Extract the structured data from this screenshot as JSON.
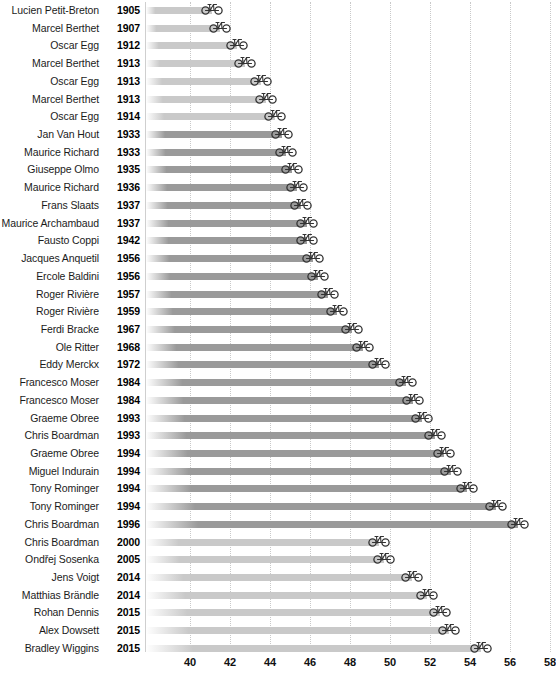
{
  "chart_data": {
    "type": "bar",
    "title": "",
    "subtitle": "",
    "xlabel": "",
    "ylabel": "",
    "orientation": "horizontal",
    "xlim": [
      38.8,
      58.6
    ],
    "xticks": [
      40,
      42,
      44,
      46,
      48,
      50,
      52,
      54,
      56,
      58
    ],
    "xtick_labels": [
      "40",
      "42",
      "44",
      "46",
      "48",
      "50",
      "52",
      "54",
      "56",
      "58"
    ],
    "grid": "vertical-dotted",
    "legend": "none",
    "marker": "bicycle-icon",
    "bar_start_value": 38.8,
    "categories": [
      "Lucien Petit-Breton 1905",
      "Marcel Berthet 1907",
      "Oscar Egg 1912",
      "Marcel Berthet 1913",
      "Oscar Egg 1913",
      "Marcel Berthet 1913",
      "Oscar Egg 1914",
      "Jan Van Hout 1933",
      "Maurice Richard 1933",
      "Giuseppe Olmo 1935",
      "Maurice Richard 1936",
      "Frans Slaats 1937",
      "Maurice Archambaud 1937",
      "Fausto Coppi 1942",
      "Jacques Anquetil 1956",
      "Ercole Baldini 1956",
      "Roger Rivière 1957",
      "Roger Rivière 1959",
      "Ferdi Bracke 1967",
      "Ole Ritter 1968",
      "Eddy Merckx 1972",
      "Francesco Moser 1984",
      "Francesco Moser 1984",
      "Graeme Obree 1993",
      "Chris Boardman 1993",
      "Graeme Obree 1994",
      "Miguel Indurain 1994",
      "Tony Rominger 1994",
      "Tony Rominger 1994",
      "Chris Boardman 1996",
      "Chris Boardman 2000",
      "Ondřej Sosenka 2005",
      "Jens Voigt 2014",
      "Matthias Brändle 2014",
      "Rohan Dennis 2015",
      "Alex Dowsett 2015",
      "Bradley Wiggins 2015"
    ],
    "values": [
      41.11,
      41.52,
      42.36,
      42.74,
      43.53,
      43.78,
      44.25,
      44.59,
      44.78,
      45.09,
      45.33,
      45.56,
      45.84,
      45.87,
      46.16,
      46.39,
      46.92,
      47.35,
      48.09,
      48.65,
      49.43,
      50.81,
      51.15,
      51.6,
      52.27,
      52.71,
      53.04,
      53.83,
      55.29,
      56.38,
      49.44,
      49.7,
      51.11,
      51.85,
      52.49,
      52.94,
      54.53
    ],
    "shade_groups": {
      "light": "#c9c9c9",
      "dark": "#9a9a9a",
      "note": "bars alternate between lighter and darker gray by era"
    }
  },
  "rows": [
    {
      "name": "Lucien Petit-Breton",
      "year": "1905",
      "value": 41.11,
      "shade": "light"
    },
    {
      "name": "Marcel Berthet",
      "year": "1907",
      "value": 41.52,
      "shade": "light"
    },
    {
      "name": "Oscar Egg",
      "year": "1912",
      "value": 42.36,
      "shade": "light"
    },
    {
      "name": "Marcel Berthet",
      "year": "1913",
      "value": 42.74,
      "shade": "light"
    },
    {
      "name": "Oscar Egg",
      "year": "1913",
      "value": 43.53,
      "shade": "light"
    },
    {
      "name": "Marcel Berthet",
      "year": "1913",
      "value": 43.78,
      "shade": "light"
    },
    {
      "name": "Oscar Egg",
      "year": "1914",
      "value": 44.25,
      "shade": "light"
    },
    {
      "name": "Jan Van Hout",
      "year": "1933",
      "value": 44.59,
      "shade": "dark"
    },
    {
      "name": "Maurice Richard",
      "year": "1933",
      "value": 44.78,
      "shade": "dark"
    },
    {
      "name": "Giuseppe Olmo",
      "year": "1935",
      "value": 45.09,
      "shade": "dark"
    },
    {
      "name": "Maurice Richard",
      "year": "1936",
      "value": 45.33,
      "shade": "dark"
    },
    {
      "name": "Frans Slaats",
      "year": "1937",
      "value": 45.56,
      "shade": "dark"
    },
    {
      "name": "Maurice Archambaud",
      "year": "1937",
      "value": 45.84,
      "shade": "dark"
    },
    {
      "name": "Fausto Coppi",
      "year": "1942",
      "value": 45.87,
      "shade": "dark"
    },
    {
      "name": "Jacques Anquetil",
      "year": "1956",
      "value": 46.16,
      "shade": "dark"
    },
    {
      "name": "Ercole Baldini",
      "year": "1956",
      "value": 46.39,
      "shade": "dark"
    },
    {
      "name": "Roger Rivière",
      "year": "1957",
      "value": 46.92,
      "shade": "dark"
    },
    {
      "name": "Roger Rivière",
      "year": "1959",
      "value": 47.35,
      "shade": "dark"
    },
    {
      "name": "Ferdi Bracke",
      "year": "1967",
      "value": 48.09,
      "shade": "dark"
    },
    {
      "name": "Ole Ritter",
      "year": "1968",
      "value": 48.65,
      "shade": "dark"
    },
    {
      "name": "Eddy Merckx",
      "year": "1972",
      "value": 49.43,
      "shade": "dark"
    },
    {
      "name": "Francesco Moser",
      "year": "1984",
      "value": 50.81,
      "shade": "dark"
    },
    {
      "name": "Francesco Moser",
      "year": "1984",
      "value": 51.15,
      "shade": "dark"
    },
    {
      "name": "Graeme Obree",
      "year": "1993",
      "value": 51.6,
      "shade": "dark"
    },
    {
      "name": "Chris Boardman",
      "year": "1993",
      "value": 52.27,
      "shade": "dark"
    },
    {
      "name": "Graeme Obree",
      "year": "1994",
      "value": 52.71,
      "shade": "dark"
    },
    {
      "name": "Miguel Indurain",
      "year": "1994",
      "value": 53.04,
      "shade": "dark"
    },
    {
      "name": "Tony Rominger",
      "year": "1994",
      "value": 53.83,
      "shade": "dark"
    },
    {
      "name": "Tony Rominger",
      "year": "1994",
      "value": 55.29,
      "shade": "dark"
    },
    {
      "name": "Chris Boardman",
      "year": "1996",
      "value": 56.38,
      "shade": "dark"
    },
    {
      "name": "Chris Boardman",
      "year": "2000",
      "value": 49.44,
      "shade": "light"
    },
    {
      "name": "Ondřej Sosenka",
      "year": "2005",
      "value": 49.7,
      "shade": "light"
    },
    {
      "name": "Jens Voigt",
      "year": "2014",
      "value": 51.11,
      "shade": "light"
    },
    {
      "name": "Matthias Brändle",
      "year": "2014",
      "value": 51.85,
      "shade": "light"
    },
    {
      "name": "Rohan Dennis",
      "year": "2015",
      "value": 52.49,
      "shade": "light"
    },
    {
      "name": "Alex Dowsett",
      "year": "2015",
      "value": 52.94,
      "shade": "light"
    },
    {
      "name": "Bradley Wiggins",
      "year": "2015",
      "value": 54.53,
      "shade": "light"
    }
  ],
  "axis": {
    "ticks": [
      "40",
      "42",
      "44",
      "46",
      "48",
      "50",
      "52",
      "54",
      "56",
      "58"
    ]
  },
  "colors": {
    "bar_light": "#c9c9c9",
    "bar_dark": "#9a9a9a",
    "grid": "#c9c9c9",
    "axis_line": "#cfcfcf",
    "text": "#1b1b1b",
    "icon": "#333333"
  }
}
